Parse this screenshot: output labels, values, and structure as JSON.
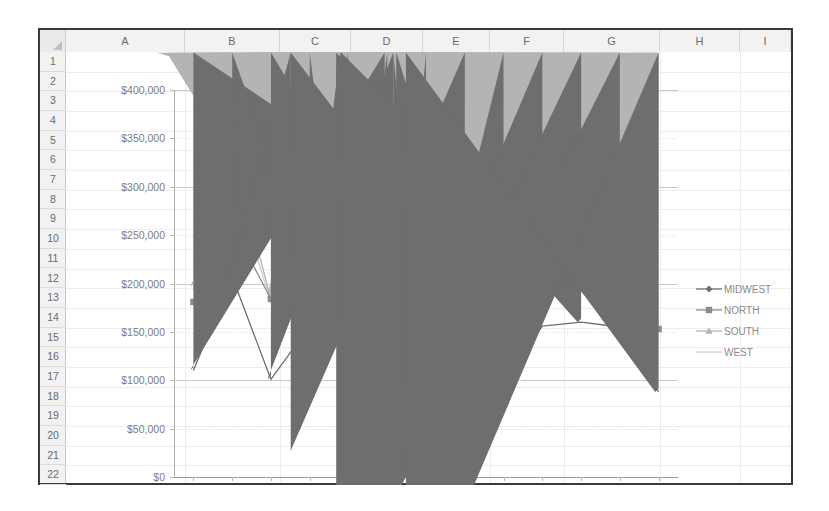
{
  "spreadsheet": {
    "columns": [
      "A",
      "B",
      "C",
      "D",
      "E",
      "F",
      "G",
      "H",
      "I"
    ],
    "rows": [
      "1",
      "2",
      "3",
      "4",
      "5",
      "6",
      "7",
      "8",
      "9",
      "10",
      "11",
      "12",
      "13",
      "14",
      "15",
      "16",
      "17",
      "18",
      "19",
      "20",
      "21",
      "22"
    ],
    "corner_label": "select-all",
    "grid_color": "#d6d6d6",
    "header_bg": "#f2f2f2",
    "frame_color": "#3a3a3a"
  },
  "chart_data": {
    "type": "line",
    "title": "",
    "xlabel": "",
    "ylabel": "",
    "categories": [
      "P01",
      "P02",
      "P03",
      "P04",
      "P05",
      "P06",
      "P07",
      "P08",
      "P09",
      "P10",
      "P11",
      "P12",
      "P13"
    ],
    "ylim": [
      0,
      400000
    ],
    "ytick_values": [
      0,
      50000,
      100000,
      150000,
      200000,
      250000,
      300000,
      350000,
      400000
    ],
    "ytick_labels": [
      "$0",
      "$50,000",
      "$100,000",
      "$150,000",
      "$200,000",
      "$250,000",
      "$300,000",
      "$350,000",
      "$400,000"
    ],
    "grid": true,
    "legend_position": "right",
    "series": [
      {
        "name": "MIDWEST",
        "marker": "diamond",
        "color": "#6e6e6e",
        "values": [
          110000,
          207000,
          101000,
          156000,
          160000,
          149000,
          101000,
          207000,
          98000,
          156000,
          160000,
          155000,
          88000
        ]
      },
      {
        "name": "NORTH",
        "marker": "square",
        "color": "#8c8c8c",
        "values": [
          181000,
          260000,
          184000,
          214000,
          235000,
          221000,
          184000,
          279000,
          170000,
          226000,
          246000,
          219000,
          153000
        ]
      },
      {
        "name": "SOUTH",
        "marker": "triangle",
        "color": "#b4b4b4",
        "values": [
          196000,
          335000,
          184000,
          255000,
          282000,
          250000,
          186000,
          345000,
          172000,
          251000,
          293000,
          259000,
          154000
        ]
      },
      {
        "name": "WEST",
        "marker": "none",
        "color": "#cfcfcf",
        "values": [
          193000,
          310000,
          181000,
          245000,
          247000,
          248000,
          180000,
          344000,
          168000,
          249000,
          290000,
          256000,
          137000
        ]
      }
    ]
  }
}
